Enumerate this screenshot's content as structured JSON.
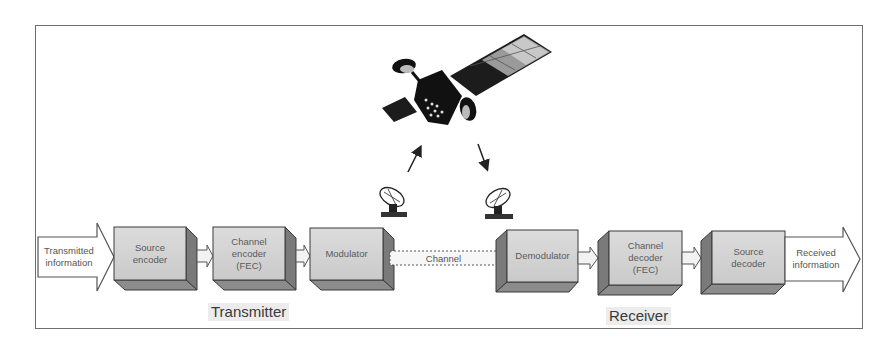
{
  "diagram": {
    "input_arrow": {
      "label": "Transmitted\ninformation"
    },
    "output_arrow": {
      "label": "Received\ninformation"
    },
    "transmitter": {
      "section_label": "Transmitter",
      "blocks": [
        {
          "id": "source-encoder",
          "label": "Source\nencoder"
        },
        {
          "id": "channel-encoder",
          "label": "Channel\nencoder\n(FEC)"
        },
        {
          "id": "modulator",
          "label": "Modulator"
        }
      ]
    },
    "channel": {
      "label": "Channel"
    },
    "receiver": {
      "section_label": "Receiver",
      "blocks": [
        {
          "id": "demodulator",
          "label": "Demodulator"
        },
        {
          "id": "channel-decoder",
          "label": "Channel\ndecoder\n(FEC)"
        },
        {
          "id": "source-decoder",
          "label": "Source\ndecoder"
        }
      ]
    },
    "icons": {
      "satellite": "satellite-icon",
      "uplink_dish": "satellite-dish-icon",
      "downlink_dish": "satellite-dish-icon",
      "uplink_arrow": "arrow-up-icon",
      "downlink_arrow": "arrow-down-icon"
    },
    "colors": {
      "box_front": "#d4d4d4",
      "box_side": "#7a7a7a",
      "box_bottom": "#8c8c8c",
      "outline": "#3a3a3a",
      "frame": "#6e6e6e"
    }
  }
}
